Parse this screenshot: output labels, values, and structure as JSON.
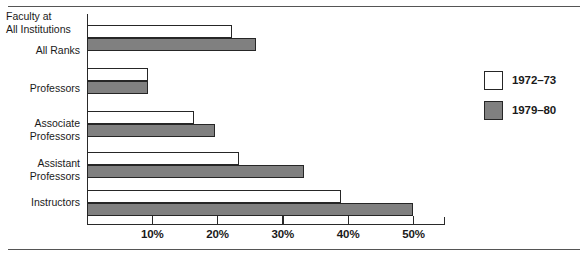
{
  "chart_data": {
    "type": "bar",
    "orientation": "horizontal",
    "title": "",
    "subtitle": "",
    "xlabel": "",
    "ylabel": "",
    "series_header": "Faculty at\nAll Institutions",
    "categories": [
      "All Ranks",
      "Professors",
      "Associate\nProfessors",
      "Assistant\nProfessors",
      "Instructors"
    ],
    "series": [
      {
        "name": "1972–73",
        "color": "#ffffff",
        "values": [
          22.2,
          9.3,
          16.4,
          23.3,
          38.9
        ]
      },
      {
        "name": "1979–80",
        "color": "#808080",
        "values": [
          25.9,
          9.3,
          19.6,
          33.2,
          49.9
        ]
      }
    ],
    "xlim": [
      0,
      54.8
    ],
    "xticks": [
      10,
      20,
      30,
      40,
      50
    ],
    "xtick_labels": [
      "10%",
      "20%",
      "30%",
      "40%",
      "50%"
    ],
    "grid": false,
    "legend_position": "right"
  },
  "legend": {
    "entries": [
      {
        "label": "1972–73",
        "swatch": "white"
      },
      {
        "label": "1979–80",
        "swatch": "gray"
      }
    ]
  },
  "colors": {
    "series_1972_73": "#ffffff",
    "series_1979_80": "#808080",
    "outline": "#262626",
    "axis": "#2a2a2a",
    "rule": "#555555",
    "background": "#ffffff"
  },
  "geometry": {
    "zero_x_px": 87,
    "px_per_percent": 6.53,
    "axis_top_px": 14,
    "axis_bottom_px": 224,
    "axis_right_px": 445,
    "bar_height_px": 13,
    "group_rows": [
      {
        "white_top_px": 25,
        "gray_top_px": 38
      },
      {
        "white_top_px": 68,
        "gray_top_px": 81
      },
      {
        "white_top_px": 111,
        "gray_top_px": 124
      },
      {
        "white_top_px": 152,
        "gray_top_px": 165
      },
      {
        "white_top_px": 190,
        "gray_top_px": 203
      }
    ],
    "label_tops_px": [
      44,
      82,
      117,
      157,
      196
    ]
  }
}
